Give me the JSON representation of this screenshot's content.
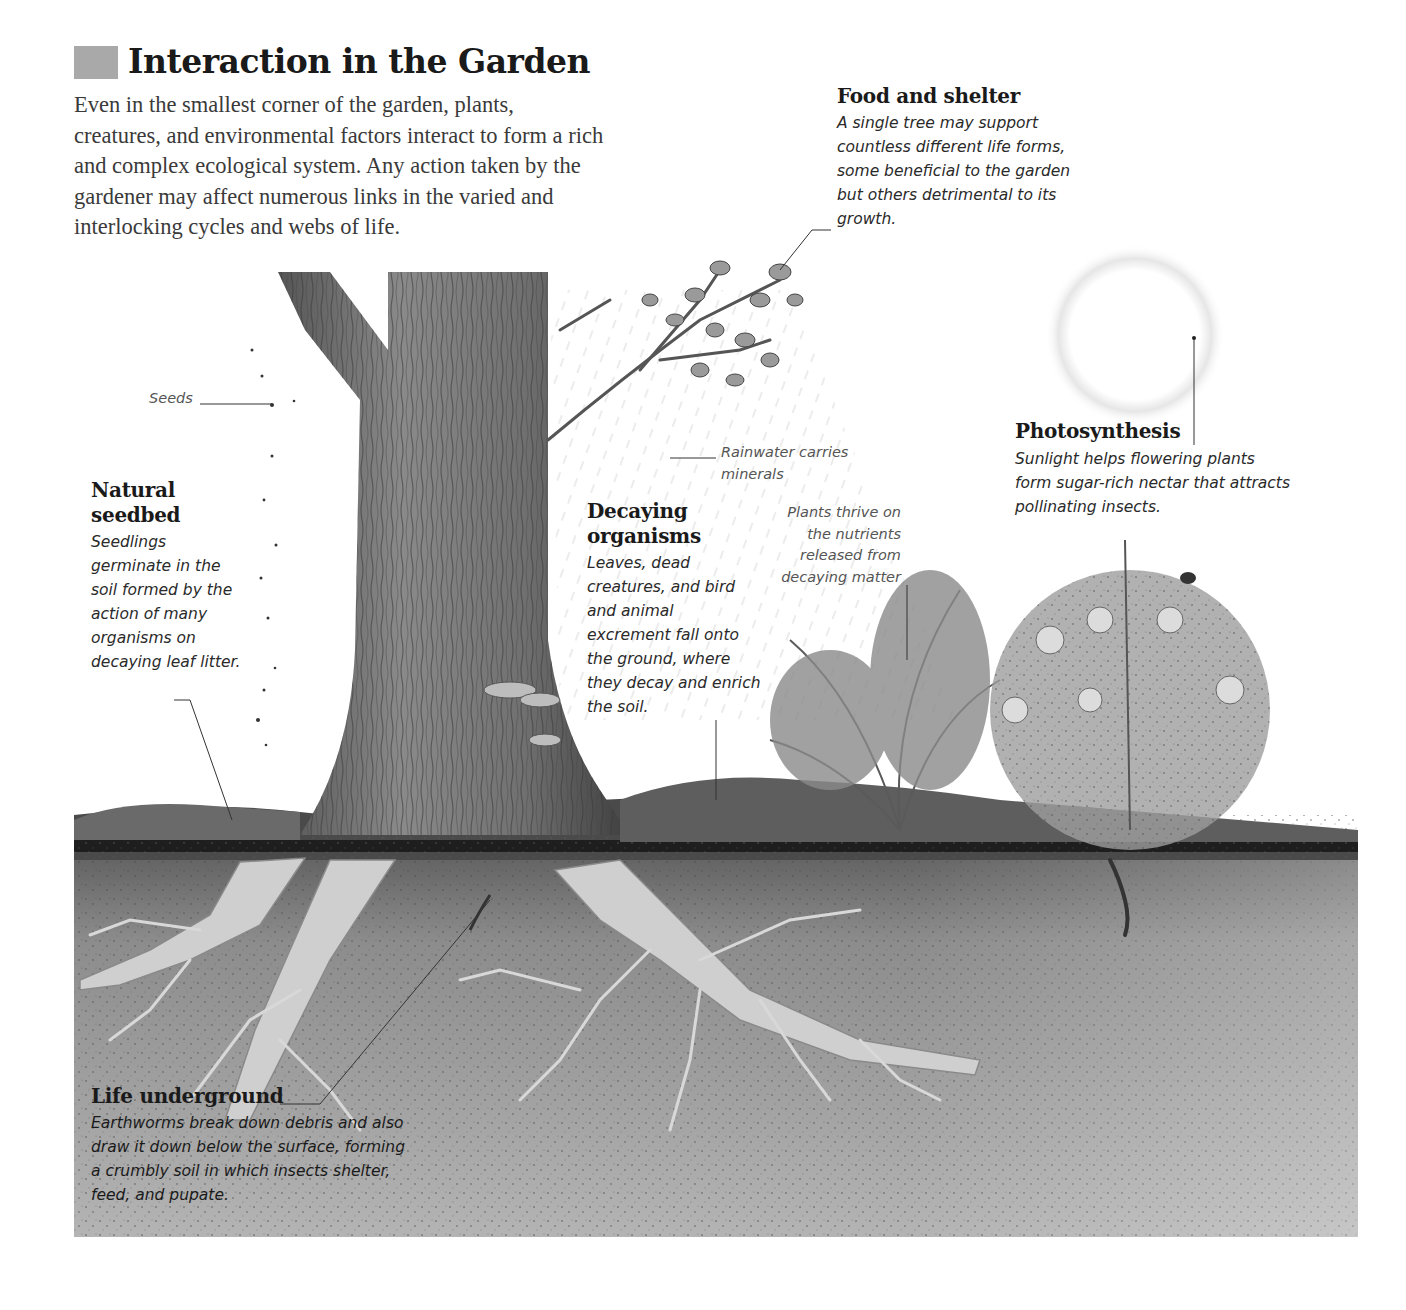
{
  "header": {
    "title": "Interaction in the Garden",
    "intro": "Even in the smallest corner of the garden, plants, creatures, and environmental factors interact to form a rich and complex ecological system. Any action taken by the gardener may affect numerous links in the varied and interlocking cycles and webs of life."
  },
  "colors": {
    "title_block": "#a9a9a9",
    "soil_top": "#3a3a3a",
    "soil": "#9a9a9a",
    "bark": "#6e6e6e",
    "root": "#cfcfcf"
  },
  "callouts": {
    "food_shelter": {
      "heading": "Food and shelter",
      "text": "A single tree may support countless different life forms, some beneficial to the garden but others detrimental to its growth."
    },
    "seeds": {
      "text": "Seeds"
    },
    "photosynthesis": {
      "heading": "Photosynthesis",
      "text": "Sunlight helps flowering plants form sugar-rich nectar that attracts pollinating insects."
    },
    "rainwater": {
      "text": "Rainwater carries minerals"
    },
    "natural_seedbed": {
      "heading_line1": "Natural",
      "heading_line2": "seedbed",
      "text": "Seedlings germinate in the soil formed by the action of many organisms on decaying leaf litter."
    },
    "decaying_organisms": {
      "heading_line1": "Decaying",
      "heading_line2": "organisms",
      "text": "Leaves, dead creatures, and bird and animal excrement fall onto the ground, where they decay and enrich the soil."
    },
    "plants_thrive": {
      "text": "Plants thrive on the nutrients released from decaying matter"
    },
    "life_underground": {
      "heading": "Life underground",
      "text": "Earthworms break down debris and also draw it down below the surface, forming a crumbly soil in which insects shelter, feed, and pupate."
    }
  }
}
